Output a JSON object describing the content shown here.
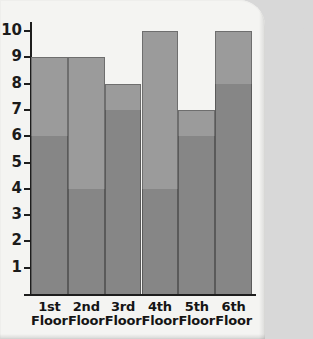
{
  "chart_data": {
    "type": "bar",
    "subtype": "stacked-bar",
    "title": "",
    "xlabel": "",
    "ylabel": "",
    "ylim": [
      0,
      10
    ],
    "yticks": [
      1,
      2,
      3,
      4,
      5,
      6,
      7,
      8,
      9,
      10
    ],
    "ytick_labels": [
      "1",
      "2",
      "3",
      "4",
      "5",
      "6",
      "7",
      "8",
      "9",
      "10"
    ],
    "grid": false,
    "legend": "none",
    "categories": [
      "1st Floor",
      "2nd Floor",
      "3rd Floor",
      "4th Floor",
      "5th Floor",
      "6th Floor"
    ],
    "category_lines": [
      [
        "1st",
        "Floor"
      ],
      [
        "2nd",
        "Floor"
      ],
      [
        "3rd",
        "Floor"
      ],
      [
        "4th",
        "Floor"
      ],
      [
        "5th",
        "Floor"
      ],
      [
        "6th",
        "Floor"
      ]
    ],
    "series": [
      {
        "name": "lower-segment",
        "color": "#868686",
        "values": [
          6,
          4,
          7,
          4,
          6,
          8
        ]
      },
      {
        "name": "upper-segment",
        "color": "#9b9b9b",
        "values": [
          3,
          5,
          1,
          6,
          1,
          2
        ]
      }
    ],
    "totals": [
      9,
      9,
      8,
      10,
      7,
      10
    ],
    "bars": [
      {
        "category": "1st Floor",
        "lower": 6,
        "upper": 3,
        "total": 9
      },
      {
        "category": "2nd Floor",
        "lower": 4,
        "upper": 5,
        "total": 9
      },
      {
        "category": "3rd Floor",
        "lower": 7,
        "upper": 1,
        "total": 8
      },
      {
        "category": "4th Floor",
        "lower": 4,
        "upper": 6,
        "total": 10
      },
      {
        "category": "5th Floor",
        "lower": 6,
        "upper": 1,
        "total": 7
      },
      {
        "category": "6th Floor",
        "lower": 8,
        "upper": 2,
        "total": 10
      }
    ]
  },
  "colors": {
    "page_background": "#f4f4f2",
    "axis": "#1d1d1d",
    "bar_lower": "#868686",
    "bar_upper": "#9b9b9b",
    "text": "#151515"
  }
}
